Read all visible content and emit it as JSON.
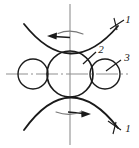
{
  "figure": {
    "background_color": "#ffffff",
    "ink_color": "#1a1a1a",
    "axis_color": "#9a9a9a",
    "width": 139,
    "height": 148
  },
  "axes": {
    "vertical": {
      "name": "vertical-centerline",
      "style": "solid-light",
      "x": 70,
      "y1": 4,
      "y2": 145,
      "color": "#a8a8a8"
    },
    "horizontal": {
      "name": "horizontal-centerline",
      "style": "dash-dot",
      "y": 74,
      "x1": 6,
      "x2": 128,
      "color": "#8f8f8f"
    }
  },
  "circles": [
    {
      "id": "center-circle",
      "label_ref": "2",
      "cx": 70,
      "cy": 74,
      "r": 23,
      "stroke_width": 1.6
    },
    {
      "id": "left-circle",
      "label_ref": "",
      "cx": 33,
      "cy": 74,
      "r": 15,
      "stroke_width": 1.4
    },
    {
      "id": "right-circle",
      "label_ref": "3",
      "cx": 105,
      "cy": 74,
      "r": 15,
      "stroke_width": 1.4
    }
  ],
  "arcs": [
    {
      "id": "upper-arc",
      "label_ref": "1",
      "description": "concave-up arc tangent to top of center circle",
      "path": "M 24,24 Q 70,82 118,26",
      "stroke_width": 1.7
    },
    {
      "id": "lower-arc",
      "label_ref": "1",
      "description": "concave-down arc tangent to bottom of center circle",
      "path": "M 24,130 Q 70,66 118,128",
      "stroke_width": 1.7
    }
  ],
  "arrows": [
    {
      "id": "upper-translation-arrow",
      "direction": "left",
      "description": "straight arrow along upper arc pointing left",
      "x": 56,
      "y": 37
    },
    {
      "id": "upper-rotation-arrow",
      "direction": "counterclockwise",
      "description": "small curved rotation arc above center, over vertical axis",
      "x": 70,
      "y": 33
    },
    {
      "id": "lower-translation-arrow",
      "direction": "right",
      "description": "straight arrow along lower arc pointing right",
      "x": 84,
      "y": 113
    },
    {
      "id": "lower-rotation-arrow",
      "direction": "clockwise",
      "description": "small curved rotation arc below center, over vertical axis",
      "x": 70,
      "y": 112
    }
  ],
  "leaders": [
    {
      "id": "leader-1-top",
      "label": "1",
      "from_x": 112,
      "from_y": 28,
      "to_x": 125,
      "to_y": 20,
      "label_x": 128,
      "label_y": 22
    },
    {
      "id": "leader-2",
      "label": "2",
      "from_x": 84,
      "from_y": 63,
      "to_x": 97,
      "to_y": 52,
      "label_x": 99,
      "label_y": 53
    },
    {
      "id": "leader-3",
      "label": "3",
      "from_x": 108,
      "from_y": 70,
      "to_x": 122,
      "to_y": 60,
      "label_x": 124,
      "label_y": 61
    },
    {
      "id": "leader-1-bottom",
      "label": "1",
      "from_x": 110,
      "from_y": 122,
      "to_x": 122,
      "to_y": 130,
      "label_x": 126,
      "label_y": 130
    }
  ],
  "labels": [
    {
      "id": "label-1-top",
      "text": "1"
    },
    {
      "id": "label-2",
      "text": "2"
    },
    {
      "id": "label-3",
      "text": "3"
    },
    {
      "id": "label-1-bottom",
      "text": "1"
    }
  ]
}
